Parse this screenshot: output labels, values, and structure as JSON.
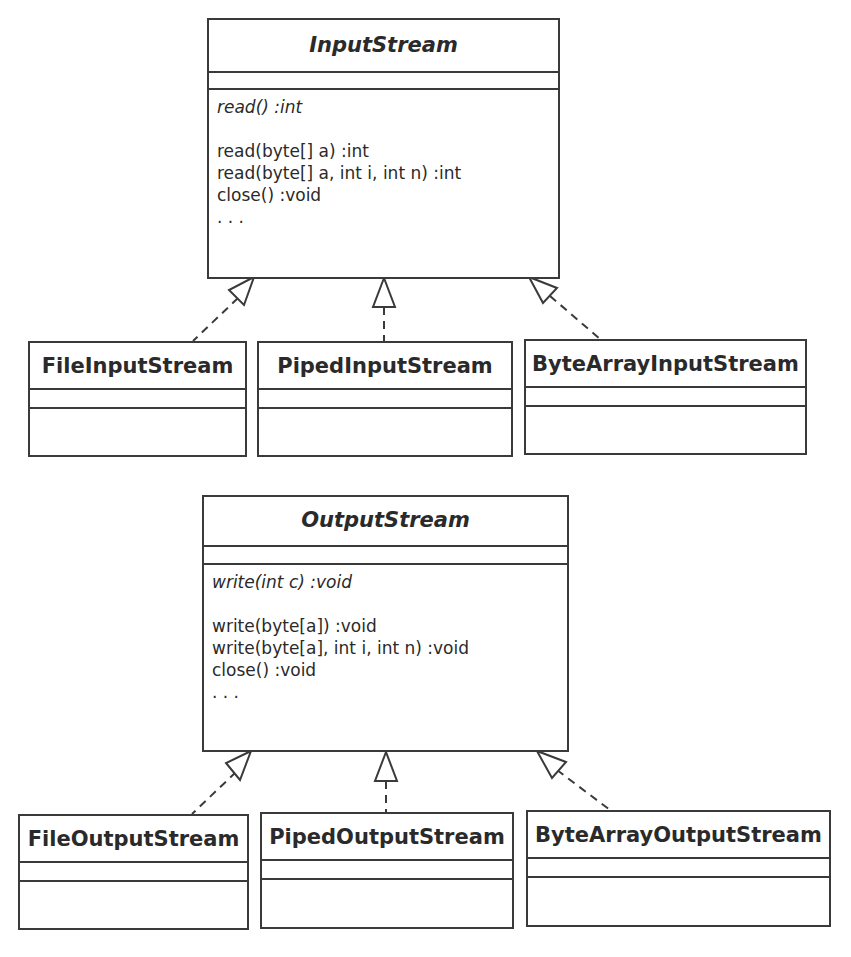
{
  "diagram": {
    "type": "uml-class-diagram",
    "input": {
      "base": {
        "name": "InputStream",
        "abstract": true,
        "abstract_ops": [
          "read() :int"
        ],
        "ops": [
          "read(byte[] a) :int",
          "read(byte[] a, int i, int n) :int",
          "close() :void",
          ". . ."
        ]
      },
      "subclasses": [
        {
          "name": "FileInputStream"
        },
        {
          "name": "PipedInputStream"
        },
        {
          "name": "ByteArrayInputStream"
        }
      ]
    },
    "output": {
      "base": {
        "name": "OutputStream",
        "abstract": true,
        "abstract_ops": [
          "write(int c) :void"
        ],
        "ops": [
          "write(byte[a]) :void",
          "write(byte[a], int i, int n) :void",
          "close() :void",
          ". . ."
        ]
      },
      "subclasses": [
        {
          "name": "FileOutputStream"
        },
        {
          "name": "PipedOutputStream"
        },
        {
          "name": "ByteArrayOutputStream"
        }
      ]
    },
    "relationships": [
      {
        "from": "FileInputStream",
        "to": "InputStream",
        "kind": "realization"
      },
      {
        "from": "PipedInputStream",
        "to": "InputStream",
        "kind": "realization"
      },
      {
        "from": "ByteArrayInputStream",
        "to": "InputStream",
        "kind": "realization"
      },
      {
        "from": "FileOutputStream",
        "to": "OutputStream",
        "kind": "realization"
      },
      {
        "from": "PipedOutputStream",
        "to": "OutputStream",
        "kind": "realization"
      },
      {
        "from": "ByteArrayOutputStream",
        "to": "OutputStream",
        "kind": "realization"
      }
    ],
    "colors": {
      "line": "#3a3a3a",
      "text": "#2a2a2a",
      "background": "#ffffff"
    }
  }
}
